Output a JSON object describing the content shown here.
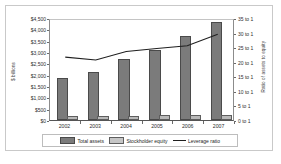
{
  "chart_data": {
    "type": "bar",
    "title": "",
    "subtitle": "",
    "xlabel": "",
    "ylabel": "$ billions",
    "ylabel_right": "Ratio of assets to equity",
    "categories": [
      "2002",
      "2003",
      "2004",
      "2005",
      "2006",
      "2007"
    ],
    "ylim": [
      0,
      4500
    ],
    "ylim_right": [
      0,
      35
    ],
    "ytick_labels": [
      "$4,500",
      "$4,000",
      "$3,500",
      "$3,000",
      "$2,500",
      "$2,000",
      "$1,500",
      "$1,000",
      "$500",
      "$0"
    ],
    "ytick_values": [
      4500,
      4000,
      3500,
      3000,
      2500,
      2000,
      1500,
      1000,
      500,
      0
    ],
    "ytick_right_labels": [
      "35 to 1",
      "30 to 1",
      "25 to 1",
      "20 to 1",
      "15 to 1",
      "10 to 1",
      "5 to 1",
      "0 to 1"
    ],
    "ytick_right_values": [
      35,
      30,
      25,
      20,
      15,
      10,
      5,
      0
    ],
    "grid": false,
    "legend_position": "bottom",
    "series": [
      {
        "name": "Total assets",
        "axis": "left",
        "kind": "bar",
        "color": "#7b7b7b",
        "values": [
          1780,
          2030,
          2600,
          2980,
          3630,
          4250
        ]
      },
      {
        "name": "Stockholder equity",
        "axis": "left",
        "kind": "bar",
        "color": "#b9b9b9",
        "values": [
          80,
          95,
          105,
          120,
          135,
          145
        ]
      },
      {
        "name": "Leverage ratio",
        "axis": "right",
        "kind": "line",
        "color": "#1f1f1f",
        "values": [
          22,
          21,
          24,
          25,
          26,
          30
        ]
      }
    ]
  },
  "legend": {
    "items": [
      {
        "label": "Total assets"
      },
      {
        "label": "Stockholder equity"
      },
      {
        "label": "Leverage ratio"
      }
    ]
  }
}
